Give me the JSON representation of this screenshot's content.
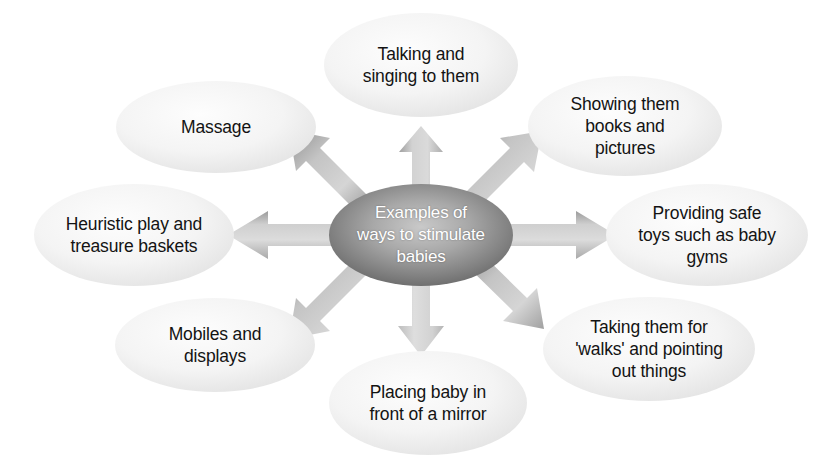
{
  "diagram": {
    "type": "spoke-and-hub-mind-map",
    "background_color": "#ffffff",
    "center": {
      "id": "center-node",
      "text": "Examples of\nways to stimulate\nbabies",
      "text_color": "#ffffff",
      "fill_center_color": "#b9b9b9",
      "fill_edge_color": "#6f6f6f",
      "cx": 421,
      "cy": 235,
      "rx": 92,
      "ry": 51
    },
    "arrow_color_light": "#d6d6d6",
    "arrow_color_dark": "#8e8e8e",
    "node_fill_center": "#fcfcfc",
    "node_fill_edge": "#e4e4e4",
    "node_text_color": "#131313",
    "nodes": [
      {
        "id": "node-talking-singing",
        "label": "Talking and\nsinging to them",
        "direction": "up",
        "cx": 421,
        "cy": 65,
        "rx": 97,
        "ry": 52
      },
      {
        "id": "node-massage",
        "label": "Massage",
        "direction": "up-left",
        "cx": 216,
        "cy": 127,
        "rx": 100,
        "ry": 46
      },
      {
        "id": "node-showing-books",
        "label": "Showing them\nbooks and\npictures",
        "direction": "up-right",
        "cx": 625,
        "cy": 126,
        "rx": 97,
        "ry": 50
      },
      {
        "id": "node-heuristic-play",
        "label": "Heuristic play and\ntreasure baskets",
        "direction": "left",
        "cx": 134,
        "cy": 235,
        "rx": 100,
        "ry": 51
      },
      {
        "id": "node-providing-toys",
        "label": "Providing safe\ntoys such as baby\ngyms",
        "direction": "right",
        "cx": 707,
        "cy": 235,
        "rx": 101,
        "ry": 51
      },
      {
        "id": "node-mobiles-displays",
        "label": "Mobiles and\ndisplays",
        "direction": "down-left",
        "cx": 215,
        "cy": 345,
        "rx": 100,
        "ry": 47
      },
      {
        "id": "node-taking-walks",
        "label": "Taking them for\n'walks' and pointing\nout things",
        "direction": "down-right",
        "cx": 649,
        "cy": 349,
        "rx": 106,
        "ry": 52
      },
      {
        "id": "node-mirror",
        "label": "Placing baby in\nfront of a mirror",
        "direction": "down",
        "cx": 428,
        "cy": 403,
        "rx": 99,
        "ry": 52
      }
    ],
    "arrows": [
      {
        "id": "arrow-up",
        "points_to": "node-talking-singing"
      },
      {
        "id": "arrow-up-left",
        "points_to": "node-massage"
      },
      {
        "id": "arrow-up-right",
        "points_to": "node-showing-books"
      },
      {
        "id": "arrow-left",
        "points_to": "node-heuristic-play"
      },
      {
        "id": "arrow-right",
        "points_to": "node-providing-toys"
      },
      {
        "id": "arrow-down-left",
        "points_to": "node-mobiles-displays"
      },
      {
        "id": "arrow-down-right",
        "points_to": "node-taking-walks"
      },
      {
        "id": "arrow-down",
        "points_to": "node-mirror"
      }
    ]
  }
}
